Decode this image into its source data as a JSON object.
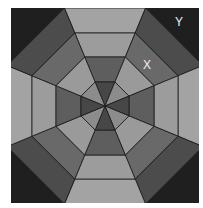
{
  "figure": {
    "center": [
      105,
      106
    ],
    "ring_apothems": [
      24,
      49,
      73,
      98
    ],
    "square": {
      "x": 11,
      "y": 8,
      "w": 188,
      "h": 195
    },
    "colors": {
      "corner": "#1f1f1f",
      "ring0_axis": "#474747",
      "ring0_diag": "#8c8c8c",
      "ring1_axis": "#5e5e5e",
      "ring1_diag": "#9a9a9a",
      "ring2_axis": "#9c9c9c",
      "ring2_diag": "#696969",
      "ring3_axis": "#a3a3a3",
      "ring3_diag": "#4c4c4c",
      "stroke": "#1a1a1a"
    }
  },
  "labels": {
    "x": "X",
    "y": "Y"
  }
}
